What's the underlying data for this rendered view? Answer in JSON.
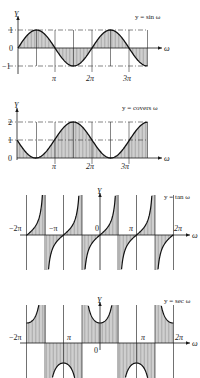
{
  "chart_data": [
    {
      "type": "line",
      "title": "y = sin ω",
      "xlabel": "ω",
      "ylabel": "Y",
      "x_ticks": [
        "π",
        "2π",
        "3π"
      ],
      "y_ticks": [
        "1",
        "0",
        "−1"
      ],
      "x_range": [
        0,
        10.996
      ],
      "ylim": [
        -1,
        1
      ],
      "shaded_area": true,
      "reference_lines": [
        1,
        -1
      ],
      "grid": "vertical lines at π/2 intervals"
    },
    {
      "type": "line",
      "title": "y = covers ω",
      "xlabel": "ω",
      "ylabel": "Y",
      "x_ticks": [
        "π",
        "2π",
        "3π"
      ],
      "y_ticks": [
        "2",
        "1",
        "0"
      ],
      "x_range": [
        0,
        10.996
      ],
      "ylim": [
        0,
        2
      ],
      "shaded_area": true,
      "reference_lines": [
        1,
        2
      ],
      "grid": "vertical lines at π/2 intervals"
    },
    {
      "type": "line",
      "title": "y = tan ω",
      "xlabel": "ω",
      "ylabel": "Y",
      "x_ticks": [
        "−2π",
        "−π",
        "0",
        "π",
        "2π"
      ],
      "x_range": [
        -6.283,
        6.283
      ],
      "asymptotes": [
        "−3π/2",
        "−π/2",
        "π/2",
        "3π/2"
      ],
      "shaded_area": true
    },
    {
      "type": "line",
      "title": "y = sec ω",
      "xlabel": "ω",
      "ylabel": "Y",
      "x_ticks": [
        "−2π",
        "π",
        "0",
        "π",
        "2π"
      ],
      "x_range": [
        -6.283,
        6.283
      ],
      "asymptotes": [
        "−3π/2",
        "−π/2",
        "π/2",
        "3π/2"
      ],
      "shaded_area": true
    }
  ],
  "charts": {
    "sin": {
      "title": "y = sin ω",
      "ylabel": "Y",
      "xlabel": "ω",
      "yt1": "1",
      "yt0": "0",
      "ytm1": "−1",
      "xt1": "π",
      "xt2": "2π",
      "xt3": "3π"
    },
    "covers": {
      "title": "y = covers ω",
      "ylabel": "Y",
      "xlabel": "ω",
      "yt2": "2",
      "yt1": "1",
      "yt0": "0",
      "xt1": "π",
      "xt2": "2π",
      "xt3": "3π"
    },
    "tan": {
      "title": "y = tan ω",
      "ylabel": "Y",
      "xlabel": "ω",
      "xtm2": "−2π",
      "xtm1": "−π",
      "xt0": "0",
      "xt1": "π",
      "xt2": "2π"
    },
    "sec": {
      "title": "y = sec ω",
      "ylabel": "Y",
      "xlabel": "ω",
      "xtm2": "−2π",
      "xtm1": "π",
      "xt0": "0",
      "xt1": "π",
      "xt2": "2π"
    }
  }
}
